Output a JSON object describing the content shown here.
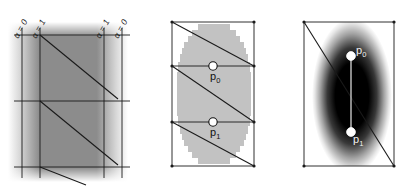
{
  "figure": {
    "panel_count": 3,
    "background_color": "#ffffff",
    "line_color": "#1a1a1a",
    "marker_fill": "#ffffff",
    "marker_stroke": "#111111"
  },
  "panels": [
    {
      "id": "panel-a",
      "name": "alpha-parameter-panel",
      "fill_style": "uniform-gray-slab-with-soft-edges",
      "base_gray": "#8c8c8c",
      "labels": [
        {
          "text": "α = 0",
          "position": "outer-left",
          "rotated": true
        },
        {
          "text": "α = 1",
          "position": "inner-left",
          "rotated": true
        },
        {
          "text": "α = 1",
          "position": "inner-right",
          "rotated": true
        },
        {
          "text": "α = 0",
          "position": "outer-right",
          "rotated": true
        }
      ],
      "vertical_rule_count": 4,
      "horizontal_rule_count": 3,
      "diagonal_count": 3,
      "point_markers": []
    },
    {
      "id": "panel-b",
      "name": "pixelated-field-panel",
      "fill_style": "pixelated-gray-ellipse",
      "base_gray": "#bfbfbf",
      "labels": [],
      "vertical_rule_count": 2,
      "horizontal_rule_count": 2,
      "diagonal_count": 3,
      "point_markers": [
        {
          "label": "p",
          "subscript": "0",
          "color": "dark"
        },
        {
          "label": "p",
          "subscript": "1",
          "color": "dark"
        }
      ]
    },
    {
      "id": "panel-c",
      "name": "smooth-gradient-panel",
      "fill_style": "smooth-dark-radial-gradient",
      "base_gray": "#000000",
      "labels": [],
      "vertical_rule_count": 2,
      "horizontal_rule_count": 0,
      "diagonal_count": 1,
      "connector_segment": true,
      "point_markers": [
        {
          "label": "p",
          "subscript": "0",
          "color": "light"
        },
        {
          "label": "p",
          "subscript": "1",
          "color": "light"
        }
      ]
    }
  ],
  "point_labels": {
    "p0_base": "p",
    "p0_sub": "0",
    "p1_base": "p",
    "p1_sub": "1"
  },
  "alpha_labels": {
    "zero": "α = 0",
    "one": "α = 1"
  }
}
